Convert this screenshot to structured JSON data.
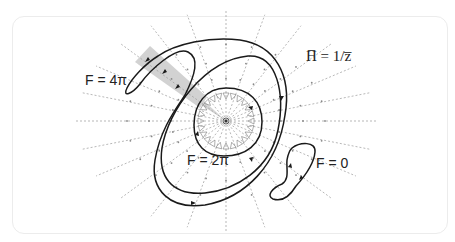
{
  "figure": {
    "labels": {
      "field": "H̅ = 1/z̅",
      "loop_4pi": "F = 4π",
      "loop_2pi": "F = 2π",
      "loop_0": "F = 0"
    },
    "center": [
      226,
      121
    ],
    "colors": {
      "curve": "#1a1a1a",
      "field_lines": "#8a8a8a",
      "shade": "#cfcfcf",
      "border": "#ececec"
    }
  }
}
